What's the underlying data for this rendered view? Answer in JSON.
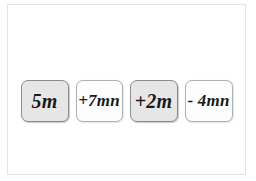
{
  "page": {
    "background_color": "#ffffff",
    "frame_border_color": "#e3e3e3"
  },
  "tiles": [
    {
      "label": "5m",
      "style": "shaded",
      "fill_color": "#e6e6e6",
      "border_color": "#8c8c8c"
    },
    {
      "label": "+7mn",
      "style": "plain",
      "fill_color": "#fdfdfd",
      "border_color": "#b0b0b0"
    },
    {
      "label": "+2m",
      "style": "shaded",
      "fill_color": "#e6e6e6",
      "border_color": "#8c8c8c"
    },
    {
      "label": "- 4mn",
      "style": "plain",
      "fill_color": "#fdfdfd",
      "border_color": "#b0b0b0"
    }
  ]
}
